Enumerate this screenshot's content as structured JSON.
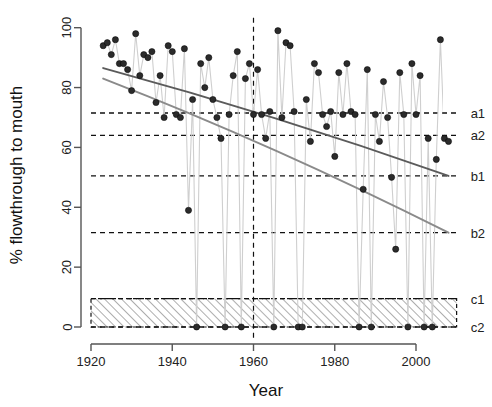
{
  "chart_data": {
    "type": "scatter",
    "title": "",
    "subtitle": "",
    "xlabel": "Year",
    "ylabel": "% flowthrough to mouth",
    "xlim": [
      1920,
      2010
    ],
    "ylim": [
      0,
      100
    ],
    "xticks": [
      1920,
      1940,
      1960,
      1980,
      2000
    ],
    "xticklabels": [
      "1920",
      "1940",
      "1960",
      "1980",
      "2000"
    ],
    "yticks": [
      0,
      20,
      40,
      60,
      80,
      100
    ],
    "yticklabels": [
      "0",
      "20",
      "40",
      "60",
      "80",
      "100"
    ],
    "grid": false,
    "legend_position": "right-outside-labels",
    "marker": "filled-circle",
    "connector_line": true,
    "series": [
      {
        "name": "% flowthrough to mouth",
        "x": [
          1923,
          1924,
          1925,
          1926,
          1927,
          1928,
          1929,
          1930,
          1931,
          1932,
          1933,
          1934,
          1935,
          1936,
          1937,
          1938,
          1939,
          1940,
          1941,
          1942,
          1943,
          1944,
          1945,
          1946,
          1947,
          1948,
          1949,
          1950,
          1951,
          1952,
          1953,
          1954,
          1955,
          1956,
          1957,
          1958,
          1959,
          1960,
          1961,
          1962,
          1963,
          1964,
          1965,
          1966,
          1967,
          1968,
          1969,
          1970,
          1971,
          1972,
          1973,
          1974,
          1975,
          1976,
          1977,
          1978,
          1979,
          1980,
          1981,
          1982,
          1983,
          1984,
          1985,
          1986,
          1987,
          1988,
          1989,
          1990,
          1991,
          1992,
          1993,
          1994,
          1995,
          1996,
          1997,
          1998,
          1999,
          2000,
          2001,
          2002,
          2003,
          2004,
          2005,
          2006,
          2007,
          2008
        ],
        "y": [
          94,
          95,
          91,
          96,
          88,
          88,
          86,
          79,
          98,
          84,
          91,
          90,
          92,
          75,
          84,
          70,
          94,
          92,
          71,
          70,
          93,
          39,
          76,
          0,
          88,
          80,
          90,
          76,
          70,
          63,
          0,
          71,
          84,
          92,
          0,
          83,
          88,
          71,
          86,
          71,
          63,
          72,
          0,
          99,
          70,
          95,
          94,
          72,
          0,
          0,
          76,
          62,
          88,
          85,
          71,
          67,
          72,
          57,
          85,
          71,
          88,
          72,
          71,
          0,
          46,
          86,
          0,
          71,
          62,
          82,
          70,
          50,
          26,
          85,
          71,
          0,
          88,
          71,
          84,
          0,
          63,
          0,
          56,
          96,
          63,
          62
        ]
      }
    ],
    "trend_lines": [
      {
        "name": "trend-upper",
        "color": "#5b5b5b",
        "x": [
          1923,
          2008
        ],
        "y": [
          86.5,
          50.5
        ],
        "curved": true
      },
      {
        "name": "trend-lower",
        "color": "#8a8a8a",
        "x": [
          1923,
          2008
        ],
        "y": [
          83.0,
          31.5
        ],
        "curved": true
      }
    ],
    "reference_lines": [
      {
        "label": "a1",
        "y": 71.5,
        "style": "dashed"
      },
      {
        "label": "a2",
        "y": 64.0,
        "style": "dashed"
      },
      {
        "label": "b1",
        "y": 50.5,
        "style": "dashed"
      },
      {
        "label": "b2",
        "y": 31.5,
        "style": "dashed"
      },
      {
        "label": "c1",
        "y": 9.5,
        "style": "dashed"
      },
      {
        "label": "c2",
        "y": 0.0,
        "style": "dashed"
      }
    ],
    "vertical_reference_lines": [
      {
        "x": 1960,
        "style": "dashed"
      }
    ],
    "shaded_regions": [
      {
        "name": "hatched-band",
        "y_from": 0.0,
        "y_to": 9.5,
        "x_from": 1920,
        "x_to": 2010,
        "fill": "hatch-diagonal"
      }
    ]
  },
  "axis": {
    "x_title": "Year",
    "y_title": "% flowthrough to mouth"
  },
  "ref_labels": {
    "a1": "a1",
    "a2": "a2",
    "b1": "b1",
    "b2": "b2",
    "c1": "c1",
    "c2": "c2"
  }
}
